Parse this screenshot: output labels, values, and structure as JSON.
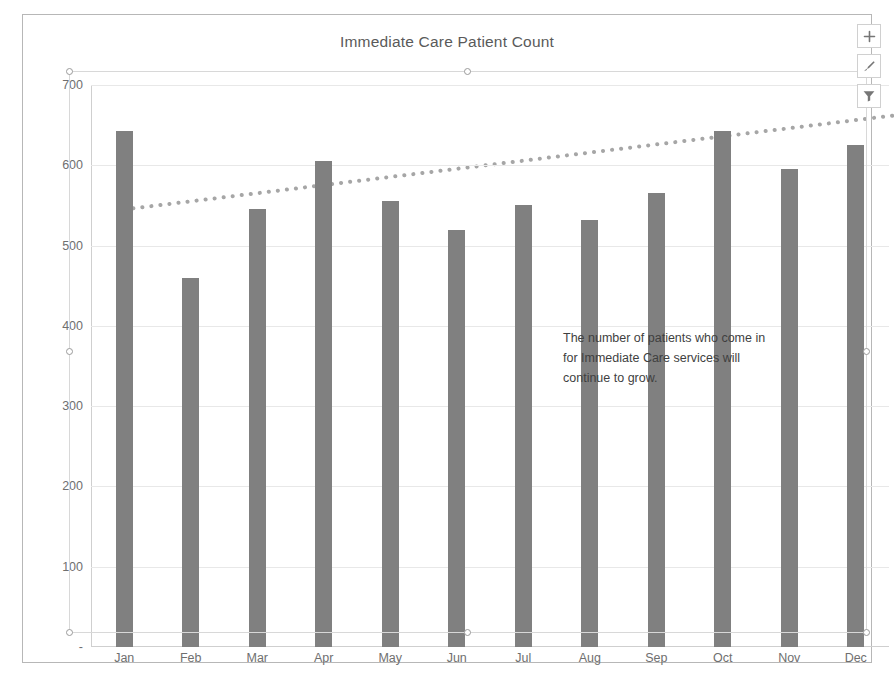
{
  "chart": {
    "title": "Immediate Care Patient Count",
    "bar_color": "#808080",
    "trendline_color": "#a6a6a6",
    "gridline_color": "#e8e8e8",
    "axis_color": "#cfcfcf",
    "border_color": "#b7b7b7"
  },
  "annotation": {
    "line1": "The number of patients who come in",
    "line2": "for Immediate Care services will",
    "line3": "continue to grow."
  },
  "buttons": [
    {
      "name": "chart-elements-button",
      "icon": "plus-icon",
      "label": "Chart Elements"
    },
    {
      "name": "chart-styles-button",
      "icon": "paintbrush-icon",
      "label": "Chart Styles"
    },
    {
      "name": "chart-filters-button",
      "icon": "funnel-icon",
      "label": "Chart Filters"
    }
  ],
  "chart_data": {
    "type": "bar",
    "title": "Immediate Care Patient Count",
    "xlabel": "",
    "ylabel": "",
    "ylim": [
      0,
      700
    ],
    "yticks": [
      0,
      100,
      200,
      300,
      400,
      500,
      600,
      700
    ],
    "ytick_labels": [
      "-",
      "100",
      "200",
      "300",
      "400",
      "500",
      "600",
      "700"
    ],
    "grid": true,
    "legend": false,
    "categories": [
      "Jan",
      "Feb",
      "Mar",
      "Apr",
      "May",
      "Jun",
      "Jul",
      "Aug",
      "Sep",
      "Oct",
      "Nov",
      "Dec"
    ],
    "series": [
      {
        "name": "Patient Count",
        "type": "bar",
        "values": [
          643,
          460,
          545,
          605,
          555,
          520,
          550,
          532,
          565,
          643,
          595,
          625
        ]
      },
      {
        "name": "Linear Trendline (forecast)",
        "type": "line",
        "style": "dotted",
        "start_value": 545,
        "end_value": 665,
        "extends_beyond_last_category": true
      }
    ],
    "annotations": [
      {
        "text": "The number of patients who come in for Immediate Care services will continue to grow."
      }
    ]
  }
}
